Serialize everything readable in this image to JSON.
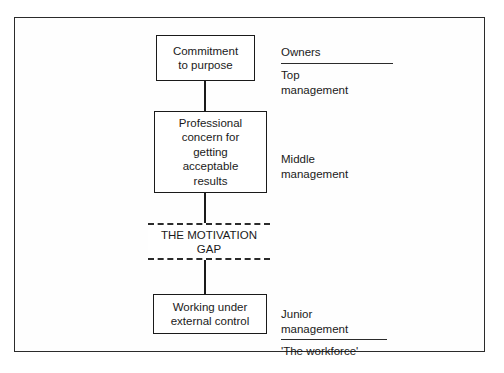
{
  "diagram": {
    "title": "The Motivation Gap",
    "boxes": [
      {
        "id": "commitment",
        "text": "Commitment\nto purpose"
      },
      {
        "id": "professional",
        "text": "Professional\nconcern for\ngetting\nacceptable\nresults"
      },
      {
        "id": "working",
        "text": "Working under\nexternal control"
      }
    ],
    "gap": {
      "label": "THE MOTIVATION\nGAP"
    },
    "side_labels": [
      {
        "id": "owners",
        "text": "Owners",
        "underlined": true
      },
      {
        "id": "top_management",
        "text": "Top\nmanagement",
        "underlined": false
      },
      {
        "id": "middle_management",
        "text": "Middle\nmanagement",
        "underlined": false
      },
      {
        "id": "junior_management",
        "text": "Junior\nmanagement",
        "underlined": true
      },
      {
        "id": "workforce",
        "text": "'The workforce'",
        "underlined": false
      }
    ]
  },
  "colors": {
    "line": "#1a1a1a",
    "frame": "#2b2b2b",
    "background": "#ffffff"
  }
}
